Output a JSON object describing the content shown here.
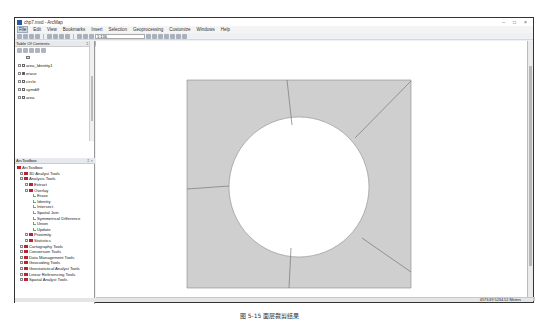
{
  "window": {
    "title": "chp7.mxd - ArcMap",
    "controls": [
      "–",
      "□",
      "×"
    ]
  },
  "menubar": {
    "items": [
      "File",
      "Edit",
      "View",
      "Bookmarks",
      "Insert",
      "Selection",
      "Geoprocessing",
      "Customize",
      "Windows",
      "Help"
    ],
    "active": "File"
  },
  "toolbar": {
    "scale_value": "1:136",
    "swat_menus": [
      "SWAT Project Setup",
      "Watershed Delineator",
      "HRU Analysis",
      "Write Input Tables",
      "Edit SWAT Input",
      "SWAT Simulation"
    ]
  },
  "toc": {
    "title": "Table Of Contents",
    "pin": "‡ ×",
    "layers": [
      {
        "name": "",
        "checked": false,
        "swatch_only": true
      },
      {
        "name": "area_Identity1",
        "checked": false
      },
      {
        "name": "erase",
        "checked": true
      },
      {
        "name": "circle",
        "checked": false
      },
      {
        "name": "symdiff",
        "checked": false
      },
      {
        "name": "area",
        "checked": false
      }
    ]
  },
  "toolbox": {
    "title": "ArcToolbox",
    "pin": "‡ ×",
    "root": "ArcToolbox",
    "items": [
      {
        "label": "3D Analyst Tools",
        "level": 1,
        "type": "toolbox"
      },
      {
        "label": "Analysis Tools",
        "level": 1,
        "type": "toolbox",
        "expanded": true
      },
      {
        "label": "Extract",
        "level": 2,
        "type": "toolset"
      },
      {
        "label": "Overlay",
        "level": 2,
        "type": "toolset",
        "expanded": true
      },
      {
        "label": "Erase",
        "level": 3,
        "type": "tool"
      },
      {
        "label": "Identity",
        "level": 3,
        "type": "tool"
      },
      {
        "label": "Intersect",
        "level": 3,
        "type": "tool"
      },
      {
        "label": "Spatial Join",
        "level": 3,
        "type": "tool"
      },
      {
        "label": "Symmetrical Difference",
        "level": 3,
        "type": "tool"
      },
      {
        "label": "Union",
        "level": 3,
        "type": "tool"
      },
      {
        "label": "Update",
        "level": 3,
        "type": "tool"
      },
      {
        "label": "Proximity",
        "level": 2,
        "type": "toolset"
      },
      {
        "label": "Statistics",
        "level": 2,
        "type": "toolset"
      },
      {
        "label": "Cartography Tools",
        "level": 1,
        "type": "toolbox"
      },
      {
        "label": "Conversion Tools",
        "level": 1,
        "type": "toolbox"
      },
      {
        "label": "Data Management Tools",
        "level": 1,
        "type": "toolbox"
      },
      {
        "label": "Geocoding Tools",
        "level": 1,
        "type": "toolbox"
      },
      {
        "label": "Geostatistical Analyst Tools",
        "level": 1,
        "type": "toolbox"
      },
      {
        "label": "Linear Referencing Tools",
        "level": 1,
        "type": "toolbox"
      },
      {
        "label": "Spatial Analyst Tools",
        "level": 1,
        "type": "toolbox"
      }
    ]
  },
  "map": {
    "fill_color": "#cfcfcf",
    "line_color": "#777777",
    "hole_color": "#ffffff"
  },
  "statusbar": {
    "coordinates": "4573.69  5234.52 Meters"
  },
  "caption": "图 5-15  面层裁剪结果"
}
